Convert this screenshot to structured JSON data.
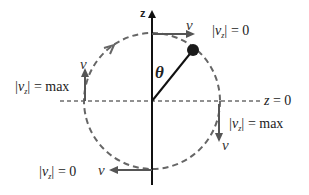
{
  "diagram": {
    "axis": {
      "label": "z"
    },
    "angle_label": "θ",
    "reference_line": {
      "label_var": "z",
      "label_eq": "= 0"
    },
    "velocity_symbol": "v",
    "annotations": {
      "top": {
        "var": "v",
        "sub": "z",
        "eq": "= 0"
      },
      "left": {
        "var": "v",
        "sub": "z",
        "eq": "= max"
      },
      "right": {
        "var": "v",
        "sub": "z",
        "eq": "= max"
      },
      "bottom": {
        "var": "v",
        "sub": "z",
        "eq": "= 0"
      }
    },
    "colors": {
      "axis": "#111111",
      "circle": "#555555",
      "arrow": "#555555",
      "ball": "#1a1a1a"
    }
  }
}
